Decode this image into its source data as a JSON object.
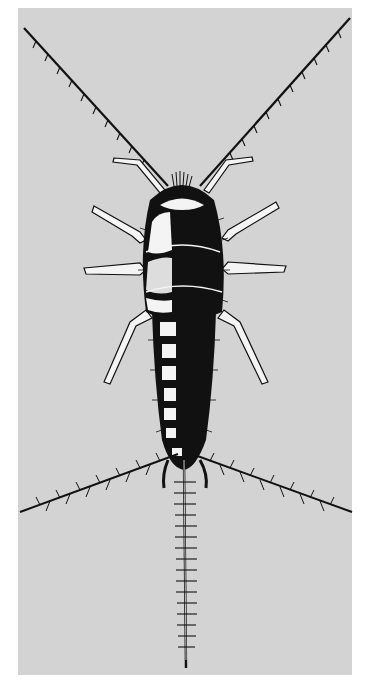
{
  "image": {
    "subject": "silverfish illustration",
    "background_color": "#ffffff",
    "panel_color": "#d3d3d3",
    "ink_color": "#111111",
    "highlight_color": "#f4f4f4"
  }
}
